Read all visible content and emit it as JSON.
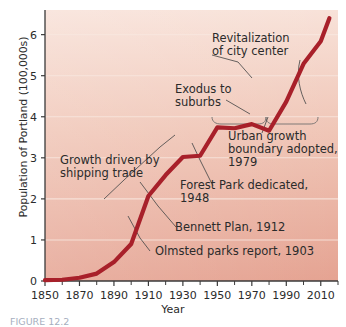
{
  "chart_data": {
    "type": "line",
    "title": "",
    "xlabel": "Year",
    "ylabel": "Population of Portland (100,000s)",
    "xlim": [
      1850,
      2020
    ],
    "ylim": [
      0,
      6.6
    ],
    "xticks": [
      1850,
      1870,
      1890,
      1910,
      1930,
      1950,
      1970,
      1990,
      2010
    ],
    "xtick_labels": [
      "1850",
      "1870",
      "1890",
      "1910",
      "1930",
      "1950",
      "1970",
      "1990",
      "2010"
    ],
    "minor_xticks": [
      1860,
      1880,
      1900,
      1920,
      1940,
      1960,
      1980,
      2000,
      2020
    ],
    "yticks": [
      0,
      1,
      2,
      3,
      4,
      5,
      6
    ],
    "ytick_labels": [
      "0",
      "1",
      "2",
      "3",
      "4",
      "5",
      "6"
    ],
    "grid": "horizontal-white",
    "legend": "none",
    "series": [
      {
        "name": "Population of Portland",
        "color": "#a8202a",
        "x": [
          1850,
          1860,
          1870,
          1880,
          1890,
          1900,
          1910,
          1920,
          1930,
          1940,
          1950,
          1960,
          1970,
          1980,
          1990,
          2000,
          2010,
          2015
        ],
        "values": [
          0.02,
          0.03,
          0.08,
          0.18,
          0.46,
          0.9,
          2.07,
          2.58,
          3.02,
          3.05,
          3.74,
          3.72,
          3.82,
          3.66,
          4.37,
          5.29,
          5.84,
          6.4
        ]
      }
    ],
    "annotations": [
      {
        "name": "revitalization",
        "lines": [
          "Revitalization",
          "of city center"
        ],
        "x": 212,
        "y": 42
      },
      {
        "name": "exodus",
        "lines": [
          "Exodus to",
          "suburbs"
        ],
        "x": 175,
        "y": 93
      },
      {
        "name": "urban-growth-boundary",
        "lines": [
          "Urban growth",
          "boundary adopted,",
          "1979"
        ],
        "x": 228,
        "y": 140
      },
      {
        "name": "forest-park",
        "lines": [
          "Forest Park dedicated,",
          "1948"
        ],
        "x": 180,
        "y": 189
      },
      {
        "name": "growth-shipping",
        "lines": [
          "Growth driven by",
          "shipping trade"
        ],
        "x": 60,
        "y": 164
      },
      {
        "name": "bennett-plan",
        "lines": [
          "Bennett Plan, 1912"
        ],
        "x": 175,
        "y": 231
      },
      {
        "name": "olmsted-parks",
        "lines": [
          "Olmsted parks report, 1903"
        ],
        "x": 155,
        "y": 255
      }
    ],
    "background": {
      "top_color": "#f6ddd2",
      "bottom_color": "#e7a898",
      "gridline_color": "#f7e3da"
    }
  },
  "caption": {
    "text": "FIGURE 12.2"
  }
}
